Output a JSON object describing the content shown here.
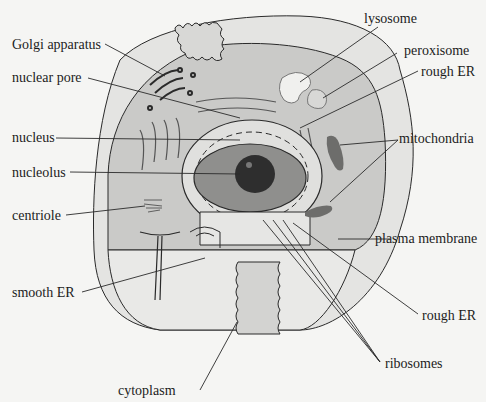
{
  "diagram": {
    "colors": {
      "background": "#f5f5f3",
      "outer_cytoplasm": "#e3e3e1",
      "inner_cytoplasm": "#c9c9c7",
      "cut_face": "#dcdcda",
      "nucleus": "#8e8e8c",
      "nucleolus": "#2e2e2e",
      "mitochondria": "#6d6d6b",
      "line": "#2a2a2a"
    },
    "labels": {
      "left": [
        {
          "id": "golgi",
          "text": "Golgi apparatus"
        },
        {
          "id": "nuclear_pore",
          "text": "nuclear pore"
        },
        {
          "id": "nucleus",
          "text": "nucleus"
        },
        {
          "id": "nucleolus",
          "text": "nucleolus"
        },
        {
          "id": "centriole",
          "text": "centriole"
        },
        {
          "id": "smooth_er",
          "text": "smooth ER"
        },
        {
          "id": "cytoplasm",
          "text": "cytoplasm"
        }
      ],
      "right": [
        {
          "id": "lysosome",
          "text": "lysosome"
        },
        {
          "id": "peroxisome",
          "text": "peroxisome"
        },
        {
          "id": "rough_er_top",
          "text": "rough ER"
        },
        {
          "id": "mitochondria",
          "text": "mitochondria"
        },
        {
          "id": "plasma_membrane",
          "text": "plasma membrane"
        },
        {
          "id": "rough_er_bottom",
          "text": "rough ER"
        },
        {
          "id": "ribosomes",
          "text": "ribosomes"
        }
      ]
    }
  }
}
